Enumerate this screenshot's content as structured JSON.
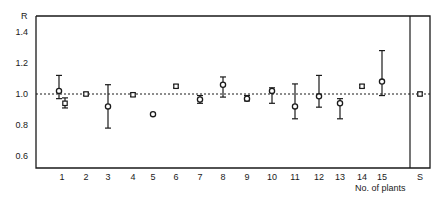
{
  "chart_data": {
    "type": "scatter",
    "title": "",
    "xlabel": "No. of plants",
    "ylabel": "R",
    "ylim": [
      0.5,
      1.5
    ],
    "yticks": [
      0.6,
      0.8,
      1.0,
      1.2,
      1.4
    ],
    "ytick_labels": [
      "0.6",
      "0.8",
      "1.0",
      "1.2",
      "1.4"
    ],
    "categories": [
      "1",
      "2",
      "3",
      "4",
      "5",
      "6",
      "7",
      "8",
      "9",
      "10",
      "11",
      "12",
      "13",
      "14",
      "15",
      "S"
    ],
    "reference_line": {
      "y": 1.0,
      "style": "dashed"
    },
    "grid": false,
    "legend": null,
    "series": [
      {
        "name": "circle markers (mean ± error)",
        "marker": "open-circle",
        "points": [
          {
            "x": "1",
            "y": 1.02,
            "lo": 0.97,
            "hi": 1.12
          },
          {
            "x": "3",
            "y": 0.92,
            "lo": 0.78,
            "hi": 1.06
          },
          {
            "x": "5",
            "y": 0.87,
            "lo": null,
            "hi": null
          },
          {
            "x": "7",
            "y": 0.965,
            "lo": 0.94,
            "hi": 0.99
          },
          {
            "x": "8",
            "y": 1.06,
            "lo": 0.98,
            "hi": 1.11
          },
          {
            "x": "9",
            "y": 0.97,
            "lo": 0.955,
            "hi": 0.99
          },
          {
            "x": "10",
            "y": 1.02,
            "lo": 0.94,
            "hi": 1.04
          },
          {
            "x": "11",
            "y": 0.92,
            "lo": 0.84,
            "hi": 1.065
          },
          {
            "x": "12",
            "y": 0.985,
            "lo": 0.915,
            "hi": 1.12
          },
          {
            "x": "13",
            "y": 0.94,
            "lo": 0.84,
            "hi": 0.97
          },
          {
            "x": "15",
            "y": 1.08,
            "lo": 0.99,
            "hi": 1.28
          }
        ]
      },
      {
        "name": "secondary markers (small symbol ± error)",
        "marker": "open-square",
        "points": [
          {
            "x": "1",
            "y": 0.94,
            "lo": 0.91,
            "hi": 0.975,
            "offset": 1
          },
          {
            "x": "2",
            "y": 1.0,
            "lo": 0.99,
            "hi": 1.01
          },
          {
            "x": "4",
            "y": 0.995,
            "lo": 0.985,
            "hi": 1.005
          },
          {
            "x": "6",
            "y": 1.05,
            "lo": 1.04,
            "hi": 1.06
          },
          {
            "x": "14",
            "y": 1.05,
            "lo": 1.04,
            "hi": 1.06
          },
          {
            "x": "S",
            "y": 1.0,
            "lo": 0.99,
            "hi": 1.01
          }
        ]
      }
    ]
  },
  "axes": {
    "y_label": "R",
    "x_label": "No. of plants",
    "separator_panel_label": "S"
  }
}
